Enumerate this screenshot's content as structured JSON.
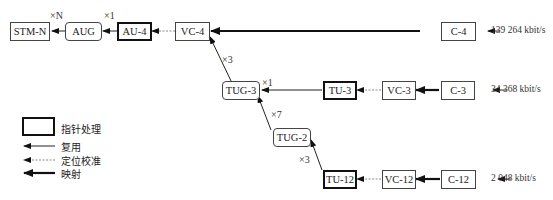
{
  "diagram": {
    "nodes": {
      "stm_n": "STM-N",
      "aug": "AUG",
      "au4": "AU-4",
      "vc4": "VC-4",
      "c4": "C-4",
      "tug3": "TUG-3",
      "tu3": "TU-3",
      "vc3": "VC-3",
      "c3": "C-3",
      "tug2": "TUG-2",
      "tu12": "TU-12",
      "vc12": "VC-12",
      "c12": "C-12"
    },
    "multipliers": {
      "stm_from_aug": "×N",
      "aug_from_au4": "×1",
      "vc4_from_tug3": "×3",
      "tug3_from_tu3": "×1",
      "tug3_from_tug2": "×7",
      "tug2_from_tu12": "×3"
    },
    "rates": {
      "c4": "139 264 kbit/s",
      "c3": "34 368 kbit/s",
      "c12": "2 048 kbit/s"
    }
  },
  "legend": {
    "pointer_processing": "指针处理",
    "multiplexing": "复用",
    "alignment": "定位校准",
    "mapping": "映射"
  }
}
